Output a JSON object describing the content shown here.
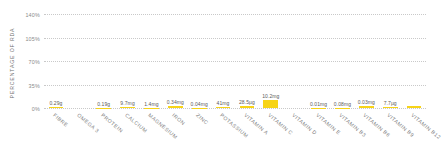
{
  "chart_data": {
    "type": "bar",
    "title": "",
    "subtitle": "",
    "xlabel": "",
    "ylabel": "PERCENTAGE OF RDA",
    "ylim": [
      0,
      140
    ],
    "yticks": [
      "0%",
      "35%",
      "70%",
      "105%",
      "140%"
    ],
    "ytick_values": [
      0,
      35,
      70,
      105,
      140
    ],
    "grid": true,
    "legend": "none",
    "bar_color": "#f7d417",
    "categories": [
      "FIBRE",
      "OMEGA 3",
      "PROTEIN",
      "CALCIUM",
      "MAGNESIUM",
      "IRON",
      "ZINC",
      "POTASSIUM",
      "VITAMIN A",
      "VITAMIN C",
      "VITAMIN D",
      "VITAMIN E",
      "VITAMIN B3",
      "VITAMIN B6",
      "VITAMIN B9",
      "VITAMIN B12"
    ],
    "values": [
      1.2,
      0,
      0.4,
      1.0,
      0.4,
      2.4,
      0.4,
      1.2,
      3.2,
      11.3,
      0,
      0.5,
      0.5,
      2.3,
      1.9,
      3.2
    ],
    "data_labels": [
      "0.29g",
      "",
      "0.19g",
      "9.7mg",
      "1.4mg",
      "0.34mg",
      "0.04mg",
      "41mg",
      "28.5µg",
      "10.2mg",
      "",
      "0.01mg",
      "0.08mg",
      "0.03mg",
      "7.7µg",
      ""
    ]
  }
}
